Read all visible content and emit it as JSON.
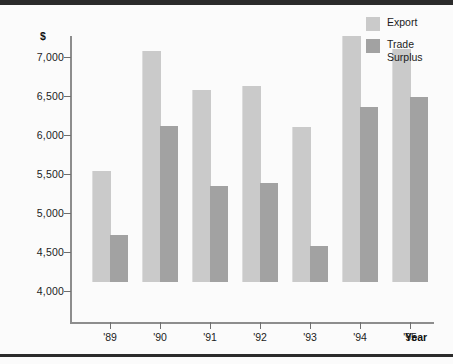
{
  "chart_data": {
    "type": "bar",
    "title": "",
    "xlabel": "Year",
    "ylabel": "$",
    "categories": [
      "'89",
      "'90",
      "'91",
      "'92",
      "'93",
      "'94",
      "'95"
    ],
    "series": [
      {
        "name": "Export",
        "color": "#cacaca",
        "values": [
          5030,
          6570,
          6060,
          6110,
          5590,
          6760,
          6590
        ]
      },
      {
        "name": "Trade\nSurplus",
        "color": "#a2a2a2",
        "values": [
          4200,
          5600,
          4830,
          4870,
          4060,
          5850,
          5970
        ]
      }
    ],
    "ylim": [
      3750,
      7000
    ],
    "yticks": [
      7000,
      6500,
      6000,
      5500,
      5000,
      4500,
      4000
    ],
    "ytick_labels": [
      "7,000",
      "6,500",
      "6,000",
      "5,500",
      "5,000",
      "4,500",
      "4,000"
    ],
    "grid": false,
    "legend_position": "top-right"
  },
  "legend": {
    "items": [
      {
        "label": "Export",
        "color": "#cacaca"
      },
      {
        "label": "Trade\nSurplus",
        "color": "#a2a2a2"
      }
    ]
  },
  "axes": {
    "y_unit_label": "$",
    "x_axis_title": "Year"
  }
}
